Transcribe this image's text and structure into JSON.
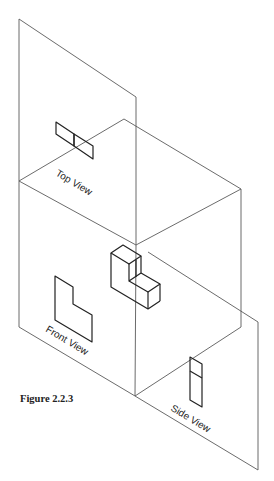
{
  "labels": {
    "top_view": "Top View",
    "front_view": "Front View",
    "side_view": "Side View"
  },
  "caption": "Figure 2.2.3",
  "colors": {
    "background": "#ffffff",
    "plane_lines": "#5a5a5a",
    "object_lines": "#222222"
  }
}
